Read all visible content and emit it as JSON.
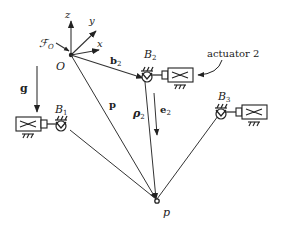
{
  "diagram": {
    "frame": {
      "label_frame": "ℱ",
      "label_frame_sub": "O",
      "origin": "O",
      "axes": {
        "x": "x",
        "y": "y",
        "z": "z"
      }
    },
    "gravity": {
      "label": "g"
    },
    "vectors": {
      "b2": {
        "main": "b",
        "sub": "2"
      },
      "p": {
        "main": "p"
      },
      "rho2": {
        "main": "ρ",
        "sub": "2"
      },
      "e2": {
        "main": "e",
        "sub": "2"
      }
    },
    "joints": {
      "B1": {
        "main": "B",
        "sub": "1"
      },
      "B2": {
        "main": "B",
        "sub": "2"
      },
      "B3": {
        "main": "B",
        "sub": "3"
      }
    },
    "point": {
      "label": "p"
    },
    "annotation": {
      "actuator": "actuator 2"
    },
    "colors": {
      "stroke": "#222222",
      "background": "#ffffff"
    }
  }
}
